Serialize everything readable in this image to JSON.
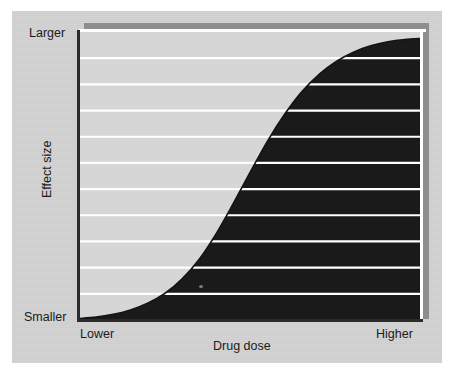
{
  "figure": {
    "background_color": "#d2d2d2",
    "page_color": "#ffffff",
    "shadow_color": "#8e8e8e",
    "axis_color": "#2b2b2b"
  },
  "chart_data": {
    "type": "area",
    "title": "",
    "subtitle": "",
    "xlabel": "Drug dose",
    "ylabel": "Effect size",
    "x_tick_labels": [
      "Lower",
      "Higher"
    ],
    "y_tick_labels": [
      "Smaller",
      "Larger"
    ],
    "xlim": [
      0,
      1
    ],
    "ylim": [
      0,
      1
    ],
    "grid": true,
    "gridline_count": 10,
    "gridline_color": "#ffffff",
    "grid_axis": "y",
    "legend": null,
    "legend_position": "none",
    "fill_color": "#1a1a1a",
    "line_color": "#111111",
    "series": [
      {
        "name": "Dose-response",
        "shape": "sigmoid",
        "x": [
          0.0,
          0.05,
          0.1,
          0.15,
          0.2,
          0.25,
          0.3,
          0.35,
          0.4,
          0.45,
          0.5,
          0.55,
          0.6,
          0.65,
          0.7,
          0.75,
          0.8,
          0.85,
          0.9,
          0.95,
          1.0
        ],
        "values": [
          0.005,
          0.01,
          0.02,
          0.035,
          0.058,
          0.092,
          0.142,
          0.21,
          0.3,
          0.405,
          0.515,
          0.622,
          0.715,
          0.793,
          0.853,
          0.898,
          0.93,
          0.952,
          0.966,
          0.974,
          0.978
        ]
      }
    ],
    "annotations": []
  },
  "labels": {
    "y_top": "Larger",
    "y_bottom": "Smaller",
    "x_left": "Lower",
    "x_right": "Higher",
    "x_title": "Drug dose",
    "y_title": "Effect size"
  }
}
